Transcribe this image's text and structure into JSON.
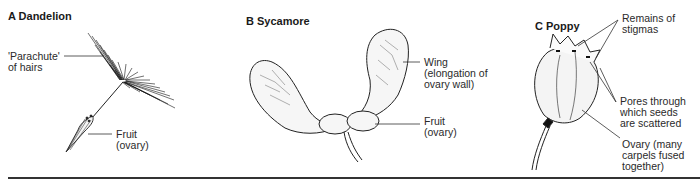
{
  "panels": [
    {
      "id": "A",
      "title": "A  Dandelion",
      "labels": [
        {
          "text": "'Parachute'\nof hairs"
        },
        {
          "text": "Fruit\n(ovary)"
        }
      ]
    },
    {
      "id": "B",
      "title": "B  Sycamore",
      "labels": [
        {
          "text": "Wing\n(elongation of\novary wall)"
        },
        {
          "text": "Fruit\n(ovary)"
        }
      ]
    },
    {
      "id": "C",
      "title": "C  Poppy",
      "labels": [
        {
          "text": "Remains of\nstigmas"
        },
        {
          "text": "Pores through\nwhich seeds\nare scattered"
        },
        {
          "text": "Ovary (many\ncarpels fused\ntogether)"
        }
      ]
    }
  ],
  "colors": {
    "ink": "#222222",
    "background": "#ffffff"
  }
}
